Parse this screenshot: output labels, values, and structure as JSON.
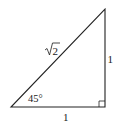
{
  "diagram": {
    "type": "right-triangle",
    "stroke_color": "#222222",
    "vertices": {
      "bottom_left": [
        11,
        107
      ],
      "bottom_right": [
        105,
        107
      ],
      "top_right": [
        105,
        9
      ]
    },
    "labels": {
      "hypotenuse": "2",
      "hypotenuse_radical": "√",
      "vertical_leg": "1",
      "horizontal_leg": "1",
      "angle": "45°"
    },
    "right_angle_marker": true
  }
}
